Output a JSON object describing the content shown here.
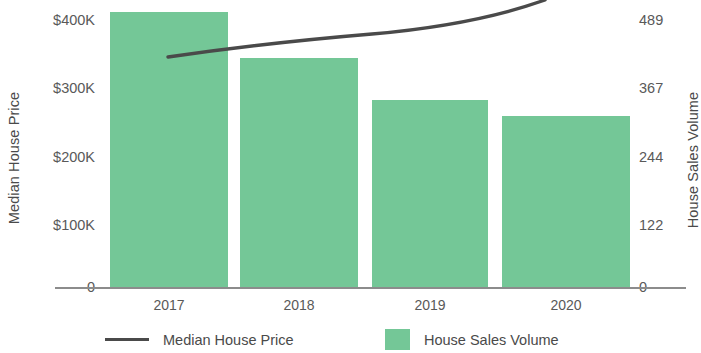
{
  "chart_data": {
    "type": "bar",
    "title": "",
    "subtitle": "",
    "categories": [
      "2017",
      "2018",
      "2019",
      "2020"
    ],
    "xlabel": "",
    "grid": false,
    "legend_position": "bottom",
    "series": [
      {
        "name": "House Sales Volume",
        "type": "bar",
        "axis": "right",
        "color": "#74c797",
        "values": [
          490,
          401,
          325,
          301
        ]
      },
      {
        "name": "Median House Price",
        "type": "line",
        "axis": "left",
        "color": "#4a4a4a",
        "values": [
          182000,
          245000,
          280000,
          420000
        ]
      }
    ],
    "y_left": {
      "label": "Median House Price",
      "ticks": [
        "0",
        "$100K",
        "$200K",
        "$300K",
        "$400K"
      ],
      "tick_values": [
        0,
        100000,
        200000,
        300000,
        400000
      ],
      "ylim": [
        0,
        400000
      ]
    },
    "y_right": {
      "label": "House Sales Volume",
      "ticks": [
        "0",
        "122",
        "244",
        "367",
        "489"
      ],
      "tick_values": [
        0,
        122,
        244,
        367,
        489
      ],
      "ylim": [
        0,
        489
      ]
    }
  },
  "axes": {
    "left_title": "Median House Price",
    "right_title": "House Sales Volume",
    "left_ticks": [
      {
        "label": "$400K",
        "y": 13
      },
      {
        "label": "$300K",
        "y": 81
      },
      {
        "label": "$200K",
        "y": 150
      },
      {
        "label": "$100K",
        "y": 218
      },
      {
        "label": "0",
        "y": 280
      }
    ],
    "right_ticks": [
      {
        "label": "489",
        "y": 13
      },
      {
        "label": "367",
        "y": 81
      },
      {
        "label": "244",
        "y": 150
      },
      {
        "label": "122",
        "y": 218
      },
      {
        "label": "0",
        "y": 280
      }
    ],
    "x_ticks": [
      {
        "label": "2017",
        "left": 110,
        "width": 118
      },
      {
        "label": "2018",
        "left": 240,
        "width": 118
      },
      {
        "label": "2019",
        "left": 372,
        "width": 116
      },
      {
        "label": "2020",
        "left": 502,
        "width": 128
      }
    ]
  },
  "bars": [
    {
      "name": "2017",
      "left": 110,
      "width": 118,
      "top": 12
    },
    {
      "name": "2018",
      "left": 240,
      "width": 118,
      "top": 58
    },
    {
      "name": "2019",
      "left": 372,
      "width": 116,
      "top": 100
    },
    {
      "name": "2020",
      "left": 502,
      "width": 128,
      "top": 116
    }
  ],
  "line": {
    "path": "M 168 57 C 230 48, 300 40, 372 34 C 440 28, 500 16, 545 0"
  },
  "legend": {
    "items": [
      {
        "name": "Median House Price",
        "marker": "line",
        "color": "#4a4a4a"
      },
      {
        "name": "House Sales Volume",
        "marker": "swatch",
        "color": "#74c797"
      }
    ]
  },
  "colors": {
    "bar_green": "#74c797",
    "line_dark": "#4a4a4a",
    "axis_gray": "#8c8c8c",
    "text_gray": "#595959"
  }
}
